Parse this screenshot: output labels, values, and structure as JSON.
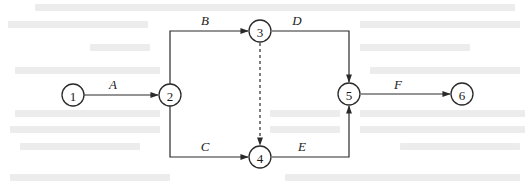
{
  "diagram": {
    "type": "activity-on-arrow network",
    "nodes": [
      {
        "id": "1",
        "label": "1",
        "x": 73,
        "y": 95
      },
      {
        "id": "2",
        "label": "2",
        "x": 170,
        "y": 95
      },
      {
        "id": "3",
        "label": "3",
        "x": 260,
        "y": 31
      },
      {
        "id": "4",
        "label": "4",
        "x": 260,
        "y": 157
      },
      {
        "id": "5",
        "label": "5",
        "x": 349,
        "y": 94
      },
      {
        "id": "6",
        "label": "6",
        "x": 462,
        "y": 94
      }
    ],
    "activities": [
      {
        "label": "A",
        "from": "1",
        "to": "2",
        "style": "solid"
      },
      {
        "label": "B",
        "from": "2",
        "to": "3",
        "style": "solid"
      },
      {
        "label": "C",
        "from": "2",
        "to": "4",
        "style": "solid"
      },
      {
        "label": "D",
        "from": "3",
        "to": "5",
        "style": "solid"
      },
      {
        "label": "E",
        "from": "4",
        "to": "5",
        "style": "solid"
      },
      {
        "label": "F",
        "from": "5",
        "to": "6",
        "style": "solid"
      },
      {
        "label": "",
        "from": "3",
        "to": "4",
        "style": "dashed",
        "kind": "dummy"
      }
    ],
    "colors": {
      "line": "#2a2a2a",
      "text": "#1a1a1a",
      "background": "#ffffff",
      "bleed_through": "#ececec"
    }
  }
}
